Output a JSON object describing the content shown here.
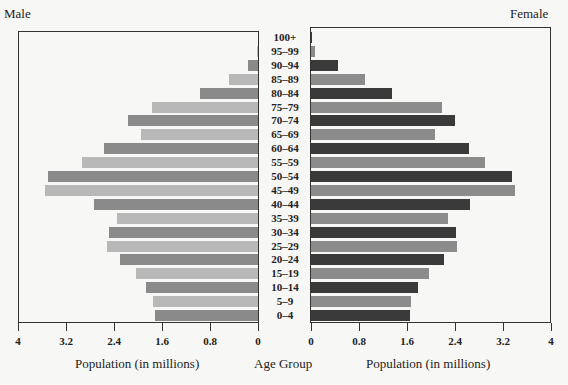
{
  "chart_data": {
    "type": "bar",
    "orientation": "horizontal",
    "subtype": "population-pyramid",
    "categories": [
      "100+",
      "95–99",
      "90–94",
      "85–89",
      "80–84",
      "75–79",
      "70–74",
      "65–69",
      "60–64",
      "55–59",
      "50–54",
      "45–49",
      "40–44",
      "35–39",
      "30–34",
      "25–29",
      "20–24",
      "15–19",
      "10–14",
      "5–9",
      "0–4"
    ],
    "series": [
      {
        "name": "Male",
        "values": [
          0.0,
          0.02,
          0.17,
          0.48,
          0.97,
          1.77,
          2.17,
          1.95,
          2.57,
          2.93,
          3.5,
          3.55,
          2.73,
          2.35,
          2.48,
          2.52,
          2.3,
          2.03,
          1.87,
          1.75,
          1.72
        ]
      },
      {
        "name": "Female",
        "values": [
          0.02,
          0.07,
          0.45,
          0.9,
          1.35,
          2.18,
          2.4,
          2.07,
          2.63,
          2.9,
          3.35,
          3.4,
          2.65,
          2.28,
          2.42,
          2.43,
          2.22,
          1.97,
          1.78,
          1.67,
          1.65
        ]
      }
    ],
    "title": "",
    "xlabel": "Population (in millions)",
    "ylabel": "Age Group",
    "xlim": [
      0,
      4
    ],
    "x_ticks": [
      "0",
      "0.8",
      "1.6",
      "2.4",
      "3.2",
      "4"
    ],
    "grid": false,
    "legend": "side labels (Male left, Female right)"
  },
  "labels": {
    "male": "Male",
    "female": "Female",
    "age_group": "Age Group",
    "x_axis_left": "Population (in millions)",
    "x_axis_right": "Population (in millions)"
  },
  "ticks_left": [
    "4",
    "3.2",
    "2.4",
    "1.6",
    "0.8",
    "0"
  ],
  "ticks_right": [
    "0",
    "0.8",
    "1.6",
    "2.4",
    "3.2",
    "4"
  ],
  "colors": {
    "male_dark": "#8a8a8a",
    "male_light": "#b8b8b8",
    "female_dark": "#3a3a3a",
    "female_light": "#8c8c8c"
  }
}
